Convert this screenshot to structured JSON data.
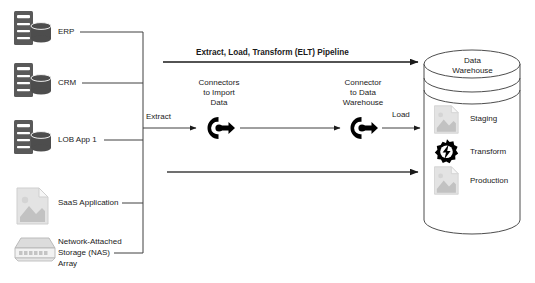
{
  "diagram": {
    "title": "Extract, Load, Transform (ELT) Pipeline",
    "sources": [
      {
        "label": "ERP",
        "icon": "server-database-icon"
      },
      {
        "label": "CRM",
        "icon": "server-database-icon"
      },
      {
        "label": "LOB App 1",
        "icon": "server-database-icon"
      },
      {
        "label": "SaaS Application",
        "icon": "document-icon"
      },
      {
        "label": "Network-Attached\nStorage (NAS)\nArray",
        "icon": "nas-array-icon"
      }
    ],
    "source_labels": {
      "erp": "ERP",
      "crm": "CRM",
      "lob": "LOB App 1",
      "saas": "SaaS Application",
      "nas_line1": "Network-Attached",
      "nas_line2": "Storage (NAS)",
      "nas_line3": "Array"
    },
    "flow_labels": {
      "extract": "Extract",
      "load": "Load"
    },
    "connectors": [
      {
        "name": "connectors-to-import-data",
        "line1": "Connectors",
        "line2": "to Import",
        "line3": "Data",
        "icon": "connector-arrow-icon"
      },
      {
        "name": "connector-to-data-warehouse",
        "line1": "Connector",
        "line2": "to Data",
        "line3": "Warehouse",
        "icon": "connector-arrow-icon"
      }
    ],
    "warehouse": {
      "title_line1": "Data",
      "title_line2": "Warehouse",
      "zones": [
        {
          "label": "Staging",
          "icon": "document-icon"
        },
        {
          "label": "Transform",
          "icon": "gear-bolt-icon"
        },
        {
          "label": "Production",
          "icon": "document-icon"
        }
      ]
    },
    "colors": {
      "line": "#404040",
      "arrow": "#1a1a1a",
      "server_icon": "#595959",
      "doc_icon": "#d9d9d9",
      "nas_icon": "#d0d0d0",
      "gear_icon": "#000000",
      "text": "#1a1a1a",
      "background": "#ffffff"
    }
  }
}
